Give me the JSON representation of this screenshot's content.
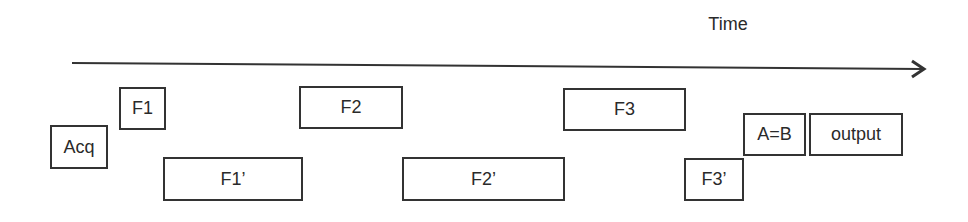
{
  "axis": {
    "label": "Time",
    "direction": "left-to-right"
  },
  "blocks": [
    {
      "id": "acq",
      "label": "Acq",
      "row": "middle"
    },
    {
      "id": "f1",
      "label": "F1",
      "row": "top"
    },
    {
      "id": "f1p",
      "label": "F1’",
      "row": "bottom"
    },
    {
      "id": "f2",
      "label": "F2",
      "row": "top"
    },
    {
      "id": "f2p",
      "label": "F2’",
      "row": "bottom"
    },
    {
      "id": "f3",
      "label": "F3",
      "row": "top"
    },
    {
      "id": "f3p",
      "label": "F3’",
      "row": "bottom"
    },
    {
      "id": "aeqb",
      "label": "A=B",
      "row": "middle"
    },
    {
      "id": "output",
      "label": "output",
      "row": "middle"
    }
  ],
  "colors": {
    "stroke": "#333333",
    "text": "#2a2a2a",
    "background": "#ffffff"
  }
}
